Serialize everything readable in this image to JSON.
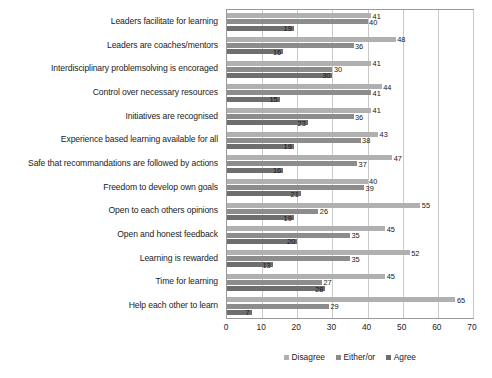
{
  "chart_data": {
    "type": "bar",
    "orientation": "horizontal",
    "title": "",
    "xlabel": "",
    "ylabel": "",
    "xlim": [
      0,
      70
    ],
    "xticks": [
      0,
      10,
      20,
      30,
      40,
      50,
      60,
      70
    ],
    "grid": true,
    "legend_position": "bottom",
    "categories": [
      "Leaders facilitate for learning",
      "Leaders are coaches/mentors",
      "Interdisciplinary problemsolving is encoraged",
      "Control over necessary resources",
      "Initiatives are recognised",
      "Experience based learning available for all",
      "Safe that recommandations are followed by actions",
      "Freedom to develop own goals",
      "Open to each others opinions",
      "Open and honest feedback",
      "Learning is rewarded",
      "Time for learning",
      "Help each other to learn"
    ],
    "series": [
      {
        "name": "Disagree",
        "color": "#b0b0b0",
        "values": [
          41,
          48,
          41,
          44,
          41,
          43,
          47,
          40,
          55,
          45,
          52,
          45,
          65
        ]
      },
      {
        "name": "Either/or",
        "color": "#8c8c8c",
        "values": [
          40,
          36,
          30,
          41,
          36,
          38,
          37,
          39,
          26,
          35,
          35,
          27,
          29
        ]
      },
      {
        "name": "Agree",
        "color": "#6e6e6e",
        "values": [
          19,
          16,
          30,
          15,
          23,
          19,
          16,
          21,
          19,
          20,
          13,
          28,
          7
        ]
      }
    ]
  },
  "legend": {
    "items": [
      {
        "label": "Disagree",
        "color": "#b0b0b0"
      },
      {
        "label": "Either/or",
        "color": "#8c8c8c"
      },
      {
        "label": "Agree",
        "color": "#6e6e6e"
      }
    ]
  }
}
